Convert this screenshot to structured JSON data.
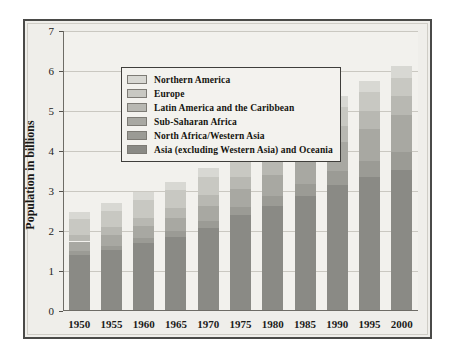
{
  "chart_data": {
    "type": "bar",
    "subtype": "stacked-bar",
    "title": "",
    "xlabel": "",
    "ylabel": "Population in billions",
    "categories": [
      "1950",
      "1955",
      "1960",
      "1965",
      "1970",
      "1975",
      "1980",
      "1985",
      "1990",
      "1995",
      "2000"
    ],
    "ylim": [
      0,
      7
    ],
    "yticks": [
      0,
      1,
      2,
      3,
      4,
      5,
      6,
      7
    ],
    "ytick_labels": [
      "0",
      "1",
      "2",
      "3",
      "4",
      "5",
      "6",
      "7"
    ],
    "grid": true,
    "legend_position": "upper-left-inside",
    "stack_order_bottom_to_top": [
      "Asia (excluding Western Asia) and Oceania",
      "North Africa/Western Asia",
      "Sub-Saharan Africa",
      "Latin America and the Caribbean",
      "Europe",
      "Northern America"
    ],
    "series": [
      {
        "name": "Asia (excluding Western Asia) and Oceania",
        "color": "#8a8a85",
        "values": [
          1.38,
          1.52,
          1.71,
          1.9,
          2.17,
          2.5,
          2.71,
          2.95,
          3.35,
          3.6,
          3.85
        ]
      },
      {
        "name": "North Africa/Western Asia",
        "color": "#9b9b95",
        "values": [
          0.1,
          0.11,
          0.13,
          0.15,
          0.18,
          0.22,
          0.26,
          0.31,
          0.37,
          0.44,
          0.51
        ]
      },
      {
        "name": "Sub-Saharan Africa",
        "color": "#a8a8a2",
        "values": [
          0.24,
          0.27,
          0.3,
          0.35,
          0.4,
          0.47,
          0.55,
          0.65,
          0.77,
          0.88,
          1.02
        ]
      },
      {
        "name": "Latin America and the Caribbean",
        "color": "#b8b8b2",
        "values": [
          0.17,
          0.19,
          0.22,
          0.26,
          0.29,
          0.33,
          0.37,
          0.41,
          0.45,
          0.49,
          0.52
        ]
      },
      {
        "name": "Europe",
        "color": "#c8c8c2",
        "values": [
          0.4,
          0.42,
          0.44,
          0.46,
          0.47,
          0.48,
          0.49,
          0.49,
          0.5,
          0.5,
          0.5
        ]
      },
      {
        "name": "Northern America",
        "color": "#d8d8d3",
        "values": [
          0.17,
          0.19,
          0.2,
          0.21,
          0.23,
          0.24,
          0.25,
          0.27,
          0.28,
          0.3,
          0.31
        ]
      }
    ],
    "totals": [
      2.46,
      2.7,
      3.0,
      3.33,
      3.74,
      4.24,
      4.63,
      5.08,
      5.72,
      6.21,
      6.71
    ],
    "bar_tops_rendered": [
      2.45,
      2.67,
      2.94,
      3.2,
      3.55,
      4.02,
      4.43,
      4.9,
      5.34,
      5.72,
      6.09
    ]
  },
  "legend": {
    "items": [
      {
        "label": "Northern America",
        "color": "#d8d8d3"
      },
      {
        "label": "Europe",
        "color": "#c8c8c2"
      },
      {
        "label": "Latin America and the Caribbean",
        "color": "#b8b8b2"
      },
      {
        "label": "Sub-Saharan Africa",
        "color": "#a8a8a2"
      },
      {
        "label": "North Africa/Western Asia",
        "color": "#9b9b95"
      },
      {
        "label": "Asia (excluding Western Asia) and Oceania",
        "color": "#8a8a85"
      }
    ]
  },
  "axes": {
    "y_title": "Population in billions"
  },
  "colors": {
    "plot_background": "#f2f1ed",
    "figure_background": "#efeeea",
    "frame_border": "#4a4a48",
    "gridline": "#cac8c1",
    "axis": "#6e6c66",
    "text": "#1c1c1a"
  }
}
